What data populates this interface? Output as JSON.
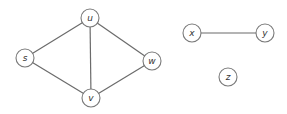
{
  "graph": {
    "nodes": [
      {
        "id": "u",
        "label": "u",
        "x": 90,
        "y": 18
      },
      {
        "id": "s",
        "label": "s",
        "x": 25,
        "y": 58
      },
      {
        "id": "w",
        "label": "w",
        "x": 152,
        "y": 61
      },
      {
        "id": "v",
        "label": "v",
        "x": 91,
        "y": 98
      },
      {
        "id": "x",
        "label": "x",
        "x": 192,
        "y": 33
      },
      {
        "id": "y",
        "label": "y",
        "x": 265,
        "y": 33
      },
      {
        "id": "z",
        "label": "z",
        "x": 228,
        "y": 77
      }
    ],
    "edges": [
      {
        "from": "s",
        "to": "u"
      },
      {
        "from": "s",
        "to": "v"
      },
      {
        "from": "u",
        "to": "v"
      },
      {
        "from": "u",
        "to": "w"
      },
      {
        "from": "v",
        "to": "w"
      },
      {
        "from": "x",
        "to": "y"
      }
    ],
    "node_radius": 9
  }
}
